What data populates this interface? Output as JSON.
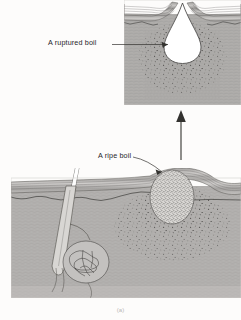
{
  "figure": {
    "caption": "(a)",
    "background_color": "#fdfcfb",
    "ink_color": "#26252a"
  },
  "labels": {
    "ruptured_boil": "A ruptured boil",
    "ripe_boil": "A ripe boil"
  },
  "panels": {
    "inset": {
      "name": "ruptured-boil-inset",
      "x": 124,
      "y": 0,
      "width": 117,
      "height": 105,
      "description": "Magnified view of a ruptured boil with open teardrop cavity breaching the skin surface",
      "tissue_color": "#b0aeac",
      "cavity_color": "#ffffff"
    },
    "main": {
      "name": "ripe-boil-main",
      "x": 11,
      "y": 178,
      "width": 230,
      "height": 120,
      "description": "Skin cross-section with hair shaft, hair follicle, sweat gland and a ripe boil",
      "tissue_color": "#b4b2b0"
    }
  },
  "structures": {
    "hair_shaft": "hair-shaft",
    "hair_follicle": "hair-follicle",
    "sweat_gland": "coiled-sweat-gland",
    "epidermis": "epidermis-layers",
    "dermis": "dermis",
    "ripe_boil_mass": "ripe-boil-stippled-mass",
    "ruptured_cavity": "ruptured-boil-cavity",
    "pus_stipple": "pus-infiltrate-stipple"
  },
  "connectors": {
    "magnify_arrow": "magnification-arrow-up",
    "ruptured_leader": "leader-line-ruptured-boil",
    "ripe_leader": "leader-line-ripe-boil"
  }
}
